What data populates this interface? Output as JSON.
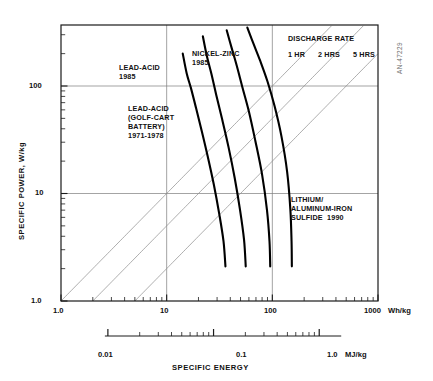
{
  "figure": {
    "code": "AN-47229",
    "background": "#ffffff",
    "axis_color": "#1a1a1a",
    "grid_color": "#7c7c7c",
    "curve_color": "#000000",
    "rate_line_color": "#8a8a8a"
  },
  "axes": {
    "x": {
      "title": "SPECIFIC ENERGY",
      "unit_label": "Wh/kg",
      "ticks": [
        "1.0",
        "10",
        "100",
        "1000"
      ],
      "tick_values": [
        1,
        10,
        100,
        1000
      ],
      "scale": "log",
      "range": [
        1,
        1000
      ]
    },
    "y": {
      "title": "SPECIFIC POWER, W/kg",
      "ticks": [
        "1.0",
        "10",
        "100"
      ],
      "tick_values": [
        1,
        10,
        100
      ],
      "scale": "log",
      "range": [
        1,
        565
      ]
    },
    "x2": {
      "unit_label": "MJ/kg",
      "ticks": [
        "0.01",
        "0.1",
        "1.0"
      ],
      "tick_values": [
        0.01,
        0.1,
        1.0
      ],
      "scale": "log",
      "range": [
        0.0036,
        1.3
      ]
    }
  },
  "chart_data": {
    "type": "line",
    "title": "",
    "xlabel": "SPECIFIC ENERGY",
    "ylabel": "SPECIFIC POWER, W/kg",
    "xscale": "log",
    "yscale": "log",
    "xlim": [
      1,
      1000
    ],
    "ylim": [
      1,
      565
    ],
    "grid": true,
    "legend": "inline-annotations",
    "series": [
      {
        "name": "LEAD-ACID (GOLF-CART BATTERY) 1971-1978",
        "points": [
          [
            14.2,
            200
          ],
          [
            15.5,
            130
          ],
          [
            17.0,
            95
          ],
          [
            19.0,
            62
          ],
          [
            21.5,
            38
          ],
          [
            24.5,
            22
          ],
          [
            28.0,
            12
          ],
          [
            31.5,
            6.4
          ],
          [
            34.5,
            3.6
          ],
          [
            36.0,
            2.1
          ]
        ]
      },
      {
        "name": "LEAD-ACID 1985",
        "points": [
          [
            22.0,
            290
          ],
          [
            24.0,
            190
          ],
          [
            26.5,
            130
          ],
          [
            29.5,
            82
          ],
          [
            33.5,
            49
          ],
          [
            38.5,
            27
          ],
          [
            44.0,
            14
          ],
          [
            49.5,
            7.0
          ],
          [
            54.0,
            3.7
          ],
          [
            56.0,
            2.1
          ]
        ]
      },
      {
        "name": "NICKEL-ZINC 1985",
        "points": [
          [
            37.0,
            330
          ],
          [
            41.0,
            230
          ],
          [
            46.0,
            155
          ],
          [
            52.0,
            98
          ],
          [
            60.0,
            58
          ],
          [
            69.0,
            31
          ],
          [
            80.0,
            15
          ],
          [
            89.0,
            7.0
          ],
          [
            94.0,
            3.6
          ],
          [
            95.5,
            2.1
          ]
        ]
      },
      {
        "name": "LITHIUM/ALUMINUM-IRON SULFIDE 1990",
        "points": [
          [
            58.0,
            350
          ],
          [
            66.0,
            250
          ],
          [
            77.0,
            170
          ],
          [
            90.0,
            110
          ],
          [
            105.0,
            65
          ],
          [
            122.0,
            34
          ],
          [
            138.0,
            16
          ],
          [
            148.0,
            7.2
          ],
          [
            152.0,
            3.6
          ],
          [
            153.0,
            2.1
          ]
        ]
      }
    ],
    "rate_lines": [
      {
        "name": "1 HR",
        "x_at_y1": 1.0,
        "slope": 1
      },
      {
        "name": "2 HRS",
        "x_at_y1": 2.0,
        "slope": 1
      },
      {
        "name": "5 HRS",
        "x_at_y1": 5.0,
        "slope": 1
      }
    ]
  },
  "annotations": {
    "lead_acid_1985": {
      "line1": "LEAD-ACID",
      "line2": "1985"
    },
    "lead_acid_golf_cart": {
      "line1": "LEAD-ACID",
      "line2": "(GOLF-CART",
      "line3": "BATTERY)",
      "line4": "1971-1978"
    },
    "nickel_zinc": {
      "line1": "NICKEL-ZINC",
      "line2": "1985"
    },
    "lithium": {
      "line1": "LITHIUM/",
      "line2": "ALUMINUM-IRON",
      "line3": "SULFIDE  1990"
    },
    "discharge_rate": {
      "heading": "DISCHARGE RATE",
      "r1": "1 HR",
      "r2": "2 HRS",
      "r3": "5 HRS"
    }
  }
}
